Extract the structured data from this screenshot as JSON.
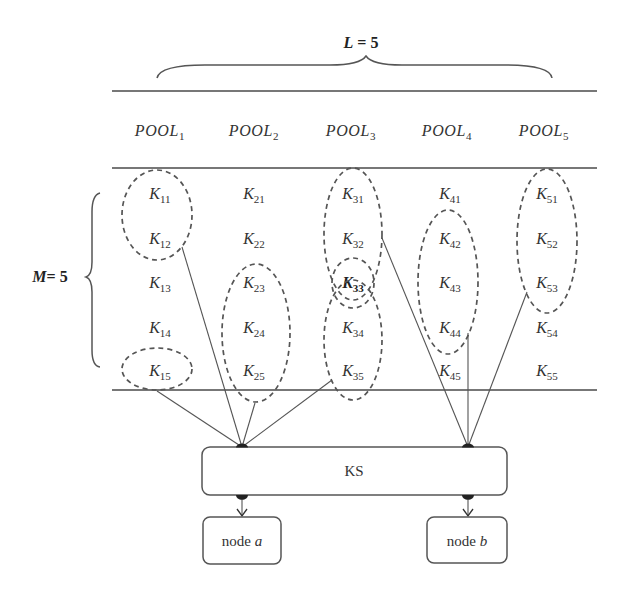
{
  "dimensions": {
    "columns": {
      "var": "L",
      "value": "= 5"
    },
    "rows": {
      "var": "M",
      "value": "= 5"
    }
  },
  "pools": [
    {
      "base": "POOL",
      "sub": "1"
    },
    {
      "base": "POOL",
      "sub": "2"
    },
    {
      "base": "POOL",
      "sub": "3"
    },
    {
      "base": "POOL",
      "sub": "4"
    },
    {
      "base": "POOL",
      "sub": "5"
    }
  ],
  "keys": [
    [
      {
        "base": "K",
        "sub": "11"
      },
      {
        "base": "K",
        "sub": "12"
      },
      {
        "base": "K",
        "sub": "13"
      },
      {
        "base": "K",
        "sub": "14"
      },
      {
        "base": "K",
        "sub": "15"
      }
    ],
    [
      {
        "base": "K",
        "sub": "21"
      },
      {
        "base": "K",
        "sub": "22"
      },
      {
        "base": "K",
        "sub": "23"
      },
      {
        "base": "K",
        "sub": "24"
      },
      {
        "base": "K",
        "sub": "25"
      }
    ],
    [
      {
        "base": "K",
        "sub": "31"
      },
      {
        "base": "K",
        "sub": "32"
      },
      {
        "base": "K",
        "sub": "33"
      },
      {
        "base": "K",
        "sub": "34"
      },
      {
        "base": "K",
        "sub": "35"
      }
    ],
    [
      {
        "base": "K",
        "sub": "41"
      },
      {
        "base": "K",
        "sub": "42"
      },
      {
        "base": "K",
        "sub": "43"
      },
      {
        "base": "K",
        "sub": "44"
      },
      {
        "base": "K",
        "sub": "45"
      }
    ],
    [
      {
        "base": "K",
        "sub": "51"
      },
      {
        "base": "K",
        "sub": "52"
      },
      {
        "base": "K",
        "sub": "53"
      },
      {
        "base": "K",
        "sub": "54"
      },
      {
        "base": "K",
        "sub": "55"
      }
    ]
  ],
  "highlighted_key": "K33",
  "groups": [
    {
      "members": [
        "K11",
        "K12"
      ],
      "target": "node a"
    },
    {
      "members": [
        "K15"
      ],
      "target": "node a"
    },
    {
      "members": [
        "K23",
        "K24",
        "K25"
      ],
      "target": "node a"
    },
    {
      "members": [
        "K31",
        "K32",
        "K33"
      ],
      "target": "node b"
    },
    {
      "members": [
        "K33"
      ],
      "target": "shared"
    },
    {
      "members": [
        "K33",
        "K34",
        "K35"
      ],
      "target": "node a"
    },
    {
      "members": [
        "K42",
        "K43",
        "K44"
      ],
      "target": "node b"
    },
    {
      "members": [
        "K51",
        "K52",
        "K53"
      ],
      "target": "node b"
    }
  ],
  "ks_box": {
    "label": "KS"
  },
  "nodes": [
    {
      "prefix": "node",
      "id": "a"
    },
    {
      "prefix": "node",
      "id": "b"
    }
  ],
  "colors": {
    "stroke": "#555555",
    "text": "#333333",
    "background": "#ffffff"
  }
}
